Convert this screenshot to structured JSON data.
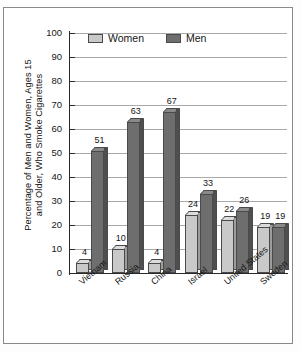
{
  "chart_data": {
    "type": "bar",
    "title": "",
    "xlabel": "",
    "ylabel": "Percentage of Men and Women, Ages 15 and Older, Who Smoke Cigarettes",
    "ylabel_line1": "Percentage of Men and Women, Ages 15",
    "ylabel_line2": "and Older, Who Smoke Cigarettes",
    "categories": [
      "Vietnam",
      "Russia",
      "China",
      "Israel",
      "United States",
      "Sweden"
    ],
    "series": [
      {
        "name": "Women",
        "color": "#c9c9c9",
        "values": [
          4,
          10,
          4,
          24,
          22,
          19
        ]
      },
      {
        "name": "Men",
        "color": "#6e6e6e",
        "values": [
          51,
          63,
          67,
          33,
          26,
          19
        ]
      }
    ],
    "ylim": [
      0,
      100
    ],
    "yticks": [
      0,
      10,
      20,
      30,
      40,
      50,
      60,
      70,
      80,
      90,
      100
    ],
    "ytick_labels": [
      "0",
      "10",
      "20",
      "30",
      "40",
      "50",
      "60",
      "70",
      "80",
      "90",
      "100"
    ],
    "grid": true,
    "grid_axis": "y",
    "legend_position": "top-left-inside",
    "data_labels": true,
    "bar_style": "3d-column"
  },
  "legend": {
    "items": [
      {
        "label": "Women",
        "color": "#c9c9c9"
      },
      {
        "label": "Men",
        "color": "#6e6e6e"
      }
    ]
  }
}
